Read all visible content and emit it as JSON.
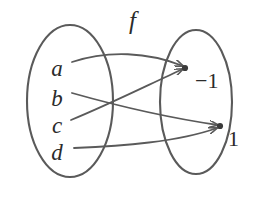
{
  "figure": {
    "title_label": "f",
    "colors": {
      "stroke": "#5a5a5a",
      "text": "#2b2b2b",
      "background": "#ffffff"
    },
    "domain_set": {
      "name": "domain-ellipse",
      "elements": [
        {
          "label": "a",
          "x": 57,
          "y": 68
        },
        {
          "label": "b",
          "x": 57,
          "y": 98
        },
        {
          "label": "c",
          "x": 57,
          "y": 125
        },
        {
          "label": "d",
          "x": 57,
          "y": 152
        }
      ]
    },
    "codomain_set": {
      "name": "codomain-ellipse",
      "elements": [
        {
          "label": "−1",
          "x": 195,
          "y": 77
        },
        {
          "label": "1",
          "x": 228,
          "y": 135
        }
      ]
    },
    "mappings": [
      {
        "from": "a",
        "to": "−1"
      },
      {
        "from": "b",
        "to": "1"
      },
      {
        "from": "c",
        "to": "−1"
      },
      {
        "from": "d",
        "to": "1"
      }
    ]
  }
}
